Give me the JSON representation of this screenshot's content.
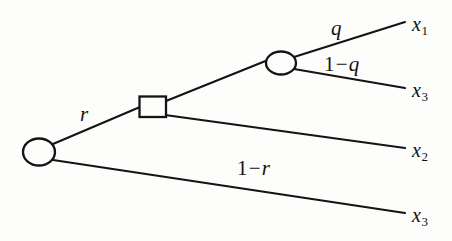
{
  "figure": {
    "kind": "extensive-form-game-tree",
    "background_color": "#fdfdfc",
    "ink_color": "#141414"
  },
  "nodes": {
    "root": {
      "name": "root-chance-node",
      "shape": "circle",
      "cx": 39,
      "cy": 152,
      "rx": 16,
      "ry": 13
    },
    "decision": {
      "name": "decision-node",
      "shape": "square",
      "x": 139,
      "y": 96,
      "width": 27,
      "height": 21
    },
    "upper": {
      "name": "upper-chance-node",
      "shape": "circle",
      "cx": 281,
      "cy": 63,
      "rx": 15,
      "ry": 11
    }
  },
  "edges": [
    {
      "id": "root-to-decision",
      "from": "root",
      "to": "decision",
      "label": "r",
      "x1": 53,
      "y1": 144,
      "x2": 139,
      "y2": 107
    },
    {
      "id": "root-to-x3-lower",
      "from": "root",
      "to": "x3-lower",
      "label": "1 − r",
      "x1": 53,
      "y1": 160,
      "x2": 405,
      "y2": 213
    },
    {
      "id": "decision-to-upper",
      "from": "decision",
      "to": "upper",
      "label": "",
      "x1": 166,
      "y1": 101,
      "x2": 267,
      "y2": 60
    },
    {
      "id": "decision-to-x2",
      "from": "decision",
      "to": "x2",
      "label": "",
      "x1": 166,
      "y1": 115,
      "x2": 405,
      "y2": 148
    },
    {
      "id": "upper-to-x1",
      "from": "upper",
      "to": "x1",
      "label": "q",
      "x1": 295,
      "y1": 58,
      "x2": 405,
      "y2": 22
    },
    {
      "id": "upper-to-x3-upper",
      "from": "upper",
      "to": "x3-upper",
      "label": "1 − q",
      "x1": 295,
      "y1": 68,
      "x2": 405,
      "y2": 88
    }
  ],
  "probability_labels": {
    "r": {
      "text": "r",
      "variable": "r"
    },
    "one_r": {
      "num": "1",
      "op": "−",
      "variable": "r"
    },
    "q": {
      "text": "q",
      "variable": "q"
    },
    "one_q": {
      "num": "1",
      "op": "−",
      "variable": "q"
    }
  },
  "outcome_labels": [
    {
      "id": "x1",
      "base": "x",
      "sub": "1"
    },
    {
      "id": "x3-upper",
      "base": "x",
      "sub": "3"
    },
    {
      "id": "x2",
      "base": "x",
      "sub": "2"
    },
    {
      "id": "x3-lower",
      "base": "x",
      "sub": "3"
    }
  ]
}
